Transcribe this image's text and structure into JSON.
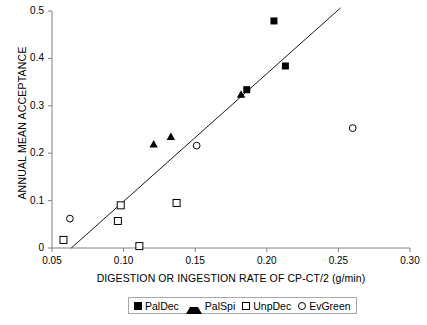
{
  "chart_data": {
    "type": "scatter",
    "title": "",
    "xlabel": "DIGESTION OR INGESTION RATE OF CP-CT/2 (g/min)",
    "ylabel": "ANNUAL MEAN ACCEPTANCE",
    "xlim": [
      0.05,
      0.3
    ],
    "ylim": [
      0,
      0.5
    ],
    "xticks": [
      "0.05",
      "0.10",
      "0.15",
      "0.20",
      "0.25",
      "0.30"
    ],
    "xtick_values": [
      0.05,
      0.1,
      0.15,
      0.2,
      0.25,
      0.3
    ],
    "yticks": [
      "0",
      "0.1",
      "0.2",
      "0.3",
      "0.4",
      "0.5"
    ],
    "ytick_values": [
      0,
      0.1,
      0.2,
      0.3,
      0.4,
      0.5
    ],
    "grid": false,
    "legend_position": "below-axis",
    "series": [
      {
        "name": "PalDec",
        "marker": "filled-square",
        "color": "#000000",
        "points": [
          {
            "x": 0.186,
            "y": 0.334
          },
          {
            "x": 0.205,
            "y": 0.479
          },
          {
            "x": 0.213,
            "y": 0.384
          }
        ]
      },
      {
        "name": "PalSpi",
        "marker": "filled-triangle",
        "color": "#000000",
        "points": [
          {
            "x": 0.121,
            "y": 0.219
          },
          {
            "x": 0.133,
            "y": 0.235
          },
          {
            "x": 0.182,
            "y": 0.324
          }
        ]
      },
      {
        "name": "UnpDec",
        "marker": "open-square",
        "color": "#000000",
        "points": [
          {
            "x": 0.058,
            "y": 0.017
          },
          {
            "x": 0.096,
            "y": 0.057
          },
          {
            "x": 0.098,
            "y": 0.09
          },
          {
            "x": 0.111,
            "y": 0.004
          },
          {
            "x": 0.137,
            "y": 0.095
          }
        ]
      },
      {
        "name": "EvGreen",
        "marker": "open-circle",
        "color": "#000000",
        "points": [
          {
            "x": 0.0625,
            "y": 0.062
          },
          {
            "x": 0.151,
            "y": 0.216
          },
          {
            "x": 0.26,
            "y": 0.253
          }
        ]
      }
    ],
    "trendline": {
      "name": "linear-fit",
      "x_start": 0.0635,
      "y_start": 0.0,
      "x_end": 0.2515,
      "y_end": 0.5065
    }
  },
  "legend": {
    "entries": [
      {
        "label": "PalDec",
        "marker": "filled-square"
      },
      {
        "label": "PalSpi",
        "marker": "filled-triangle"
      },
      {
        "label": "UnpDec",
        "marker": "open-square"
      },
      {
        "label": "EvGreen",
        "marker": "open-circle"
      }
    ]
  }
}
